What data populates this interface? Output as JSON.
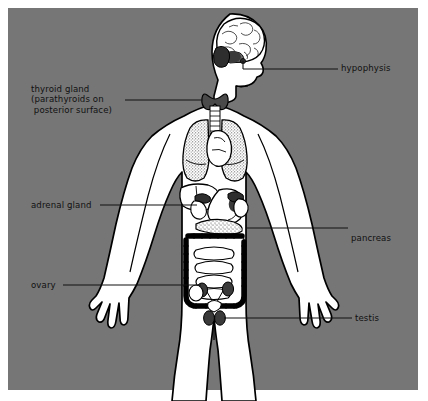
{
  "figure": {
    "background_color": "#767676",
    "body_fill": "#ffffff",
    "outline_color": "#000000",
    "organ_shade_dark": "#3a3a3a",
    "organ_shade_mid": "#8f8f8f",
    "label_color": "#111111"
  },
  "labels": {
    "hypophysis": "hypophysis",
    "thyroid": "thyroid gland\n(parathyroids on\n posterior surface)",
    "thyroid_line1": "thyroid gland",
    "thyroid_line2": "(parathyroids on",
    "thyroid_line3": " posterior surface)",
    "adrenal": "adrenal gland",
    "pancreas": "pancreas",
    "ovary": "ovary",
    "testis": "testis"
  },
  "structures": {
    "brain": "brain",
    "pituitary": "hypophysis-pituitary-gland",
    "thyroid_gland": "thyroid-gland",
    "trachea": "trachea",
    "lung_left": "left-lung",
    "lung_right": "right-lung",
    "heart": "heart",
    "liver": "liver",
    "stomach": "stomach",
    "pancreas_organ": "pancreas",
    "adrenal_left": "left-adrenal-gland",
    "adrenal_right": "right-adrenal-gland",
    "kidney_left": "left-kidney",
    "kidney_right": "right-kidney",
    "large_intestine": "large-intestine",
    "small_intestine": "small-intestine",
    "ovary_left": "left-ovary",
    "ovary_right": "right-ovary",
    "testis_left": "left-testis",
    "testis_right": "right-testis"
  }
}
